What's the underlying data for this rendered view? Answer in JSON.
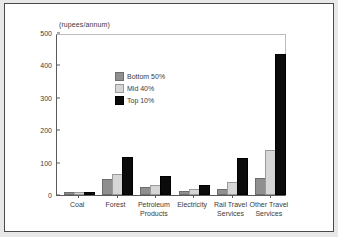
{
  "chart_data": {
    "type": "bar",
    "title": "",
    "subtitle": "",
    "unit_label": "(rupees/annum)",
    "xlabel": "",
    "ylabel": "",
    "ylim": [
      0,
      500
    ],
    "yticks": [
      0,
      100,
      200,
      300,
      400,
      500
    ],
    "ytick_labels": [
      "0",
      "100",
      "200",
      "300",
      "400",
      "500"
    ],
    "grid": false,
    "legend_position": "top-left",
    "categories": [
      "Coal",
      "Forest",
      "Petroleum Products",
      "Electricity",
      "Rail Travel Services",
      "Other Travel Services"
    ],
    "category_labels": [
      "Coal",
      "Forest",
      "Petroleum\nProducts",
      "Electricity",
      "Rail Travel\nServices",
      "Other Travel\nServices"
    ],
    "series": [
      {
        "name": "Bottom 50%",
        "color": "#8f8f8f",
        "values": [
          1,
          42,
          20,
          7,
          13,
          46
        ]
      },
      {
        "name": "Mid 40%",
        "color": "#d6d6d6",
        "values": [
          1,
          58,
          26,
          12,
          35,
          132
        ]
      },
      {
        "name": "Top 10%",
        "color": "#0b0b0b",
        "values": [
          3,
          112,
          52,
          25,
          108,
          430
        ]
      }
    ]
  },
  "legend": {
    "items": [
      {
        "label": "Bottom 50%"
      },
      {
        "label": "Mid 40%"
      },
      {
        "label": "Top 10%"
      }
    ]
  },
  "colors": {
    "bottom_50": "#8f8f8f",
    "mid_40": "#d6d6d6",
    "top_10": "#0b0b0b",
    "axis": "#5a5a5a",
    "frame": "#4a4a4a",
    "page_background": "#e8e8e8",
    "plot_background": "#ffffff"
  }
}
